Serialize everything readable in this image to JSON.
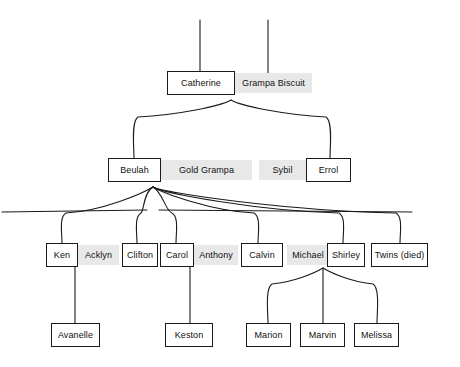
{
  "diagram": {
    "style": {
      "box_border_color": "#1a1a1a",
      "box_fill_color": "#ffffff",
      "shaded_fill_color": "#e8e8e8",
      "line_color": "#1a1a1a",
      "background_color": "#ffffff"
    },
    "generations": [
      {
        "name": "generation-1",
        "people": [
          {
            "label": "Catherine",
            "style": "boxed",
            "x": 167,
            "y": 71,
            "w": 68,
            "h": 24
          },
          {
            "label": "Grampa Biscuit",
            "style": "shaded",
            "x": 235,
            "y": 73,
            "w": 77,
            "h": 20
          }
        ]
      },
      {
        "name": "generation-2",
        "people": [
          {
            "label": "Beulah",
            "style": "boxed",
            "x": 108,
            "y": 158,
            "w": 53,
            "h": 24
          },
          {
            "label": "Gold Grampa",
            "style": "shaded",
            "x": 161,
            "y": 160,
            "w": 91,
            "h": 20
          },
          {
            "label": "Sybil",
            "style": "shaded",
            "x": 259,
            "y": 160,
            "w": 47,
            "h": 20
          },
          {
            "label": "Errol",
            "style": "boxed",
            "x": 306,
            "y": 158,
            "w": 45,
            "h": 24
          }
        ]
      },
      {
        "name": "generation-3",
        "people": [
          {
            "label": "Ken",
            "style": "boxed",
            "x": 46,
            "y": 243,
            "w": 32,
            "h": 24
          },
          {
            "label": "Acklyn",
            "style": "shaded",
            "x": 78,
            "y": 245,
            "w": 41,
            "h": 20
          },
          {
            "label": "Clifton",
            "style": "boxed",
            "x": 122,
            "y": 243,
            "w": 36,
            "h": 24
          },
          {
            "label": "Carol",
            "style": "boxed",
            "x": 160,
            "y": 243,
            "w": 34,
            "h": 24
          },
          {
            "label": "Anthony",
            "style": "shaded",
            "x": 194,
            "y": 245,
            "w": 44,
            "h": 20
          },
          {
            "label": "Calvin",
            "style": "boxed",
            "x": 241,
            "y": 243,
            "w": 42,
            "h": 24
          },
          {
            "label": "Michael",
            "style": "shaded",
            "x": 287,
            "y": 245,
            "w": 42,
            "h": 20
          },
          {
            "label": "Shirley",
            "style": "boxed",
            "x": 327,
            "y": 243,
            "w": 38,
            "h": 24
          },
          {
            "label": "Twins (died)",
            "style": "boxed",
            "x": 371,
            "y": 243,
            "w": 57,
            "h": 24
          }
        ]
      },
      {
        "name": "generation-4",
        "people": [
          {
            "label": "Avanelle",
            "style": "boxed",
            "x": 51,
            "y": 323,
            "w": 49,
            "h": 24
          },
          {
            "label": "Keston",
            "style": "boxed",
            "x": 165,
            "y": 323,
            "w": 48,
            "h": 24
          },
          {
            "label": "Marion",
            "style": "boxed",
            "x": 246,
            "y": 323,
            "w": 45,
            "h": 24
          },
          {
            "label": "Marvin",
            "style": "boxed",
            "x": 300,
            "y": 323,
            "w": 45,
            "h": 24
          },
          {
            "label": "Melissa",
            "style": "boxed",
            "x": 354,
            "y": 323,
            "w": 45,
            "h": 24
          }
        ]
      }
    ],
    "connectors": {
      "top_stems": [
        {
          "name": "stem-catherine",
          "x": 200,
          "y1": 20,
          "y2": 71
        },
        {
          "name": "stem-grampa-biscuit",
          "x": 268,
          "y1": 20,
          "y2": 73
        }
      ],
      "catherine_fan": {
        "name": "catherine-to-children-fan",
        "apex_x": 231,
        "apex_y": 100,
        "spine_y": 115,
        "ends": [
          134,
          330
        ]
      },
      "gold_grampa_fan": {
        "name": "gold-grampa-to-children-fan",
        "apex_x": 153,
        "apex_y": 187,
        "spine_y": 211,
        "left_edge": 2,
        "right_edge": 412,
        "ends": [
          62,
          137,
          176,
          258,
          343,
          400
        ]
      },
      "shirley_fan": {
        "name": "shirley-to-children-fan",
        "apex_x": 323,
        "apex_y": 268,
        "spine_y": 282,
        "ends": [
          268,
          323,
          377
        ]
      },
      "straight_links": [
        {
          "name": "acklyn-to-avanelle",
          "x": 75,
          "y1": 267,
          "y2": 323
        },
        {
          "name": "carol-to-keston",
          "x": 190,
          "y1": 267,
          "y2": 323
        }
      ]
    }
  }
}
